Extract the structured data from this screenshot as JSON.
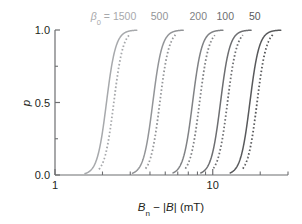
{
  "figure": {
    "background": "#ffffff",
    "plot_frame": {
      "left": 55,
      "right": 288,
      "top": 30,
      "bottom": 175
    }
  },
  "axes": {
    "y": {
      "label": "p",
      "label_italic": true,
      "ticks": [
        "0.0",
        "0.5",
        "1.0"
      ],
      "tick_values": [
        0.0,
        0.5,
        1.0
      ],
      "minor_tick_values": [
        0.25,
        0.75
      ],
      "range": [
        0.0,
        1.0
      ]
    },
    "x": {
      "label_main": "B",
      "label_sub": "n",
      "label_rest": " − |B| (mT)",
      "label_full": "Bn − |B| (mT)",
      "scale": "log",
      "ticks": [
        "1",
        "10"
      ],
      "tick_values": [
        1,
        10
      ],
      "range": [
        1,
        30
      ]
    }
  },
  "colors": {
    "axis": "#6d6e71",
    "text": "#231f20",
    "curve_lightest": "#a7a9ac",
    "curve_light": "#939598",
    "curve_mid": "#808285",
    "curve_dark": "#6d6e71",
    "curve_darkest": "#58595b"
  },
  "chart_data": {
    "type": "line",
    "title": "",
    "xlabel": "Bn − |B| (mT)",
    "ylabel": "p",
    "xscale": "log",
    "xlim": [
      1,
      30
    ],
    "ylim": [
      0.0,
      1.0
    ],
    "grid": false,
    "legend": "inline-top-labels",
    "annotations": [
      {
        "text": "β₀ = 1500",
        "x": 2.35,
        "y": 1.09
      },
      {
        "text": "500",
        "x": 4.6,
        "y": 1.09
      },
      {
        "text": "200",
        "x": 8.1,
        "y": 1.09
      },
      {
        "text": "100",
        "x": 12.0,
        "y": 1.09
      },
      {
        "text": "50",
        "x": 18.5,
        "y": 1.09
      }
    ],
    "series": [
      {
        "name": "β₀ = 1500 (solid)",
        "style": "solid",
        "color": "#a7a9ac",
        "midpoint_x": 2.12,
        "steepness": 34,
        "x_start": 1.55,
        "x_end": 3.3
      },
      {
        "name": "β₀ = 1500 (dotted)",
        "style": "dotted",
        "color": "#a7a9ac",
        "midpoint_x": 2.36,
        "steepness": 34,
        "x_start": 1.9,
        "x_end": 2.95
      },
      {
        "name": "β₀ = 500 (solid)",
        "style": "solid",
        "color": "#939598",
        "midpoint_x": 4.17,
        "steepness": 34,
        "x_start": 3.1,
        "x_end": 6.5
      },
      {
        "name": "β₀ = 500 (dotted)",
        "style": "dotted",
        "color": "#939598",
        "midpoint_x": 4.62,
        "steepness": 34,
        "x_start": 3.75,
        "x_end": 5.8
      },
      {
        "name": "β₀ = 200 (solid)",
        "style": "solid",
        "color": "#808285",
        "midpoint_x": 7.45,
        "steepness": 34,
        "x_start": 5.6,
        "x_end": 11.6
      },
      {
        "name": "β₀ = 200 (dotted)",
        "style": "dotted",
        "color": "#808285",
        "midpoint_x": 8.25,
        "steepness": 34,
        "x_start": 6.7,
        "x_end": 10.3
      },
      {
        "name": "β₀ = 100 (solid)",
        "style": "solid",
        "color": "#6d6e71",
        "midpoint_x": 11.2,
        "steepness": 34,
        "x_start": 8.4,
        "x_end": 17.5
      },
      {
        "name": "β₀ = 100 (dotted)",
        "style": "dotted",
        "color": "#6d6e71",
        "midpoint_x": 12.4,
        "steepness": 34,
        "x_start": 10.1,
        "x_end": 15.5
      },
      {
        "name": "β₀ = 50 (solid)",
        "style": "solid",
        "color": "#58595b",
        "midpoint_x": 17.2,
        "steepness": 34,
        "x_start": 12.9,
        "x_end": 27.0
      },
      {
        "name": "β₀ = 50 (dotted)",
        "style": "dotted",
        "color": "#58595b",
        "midpoint_x": 19.1,
        "steepness": 34,
        "x_start": 15.5,
        "x_end": 24.0
      }
    ]
  }
}
